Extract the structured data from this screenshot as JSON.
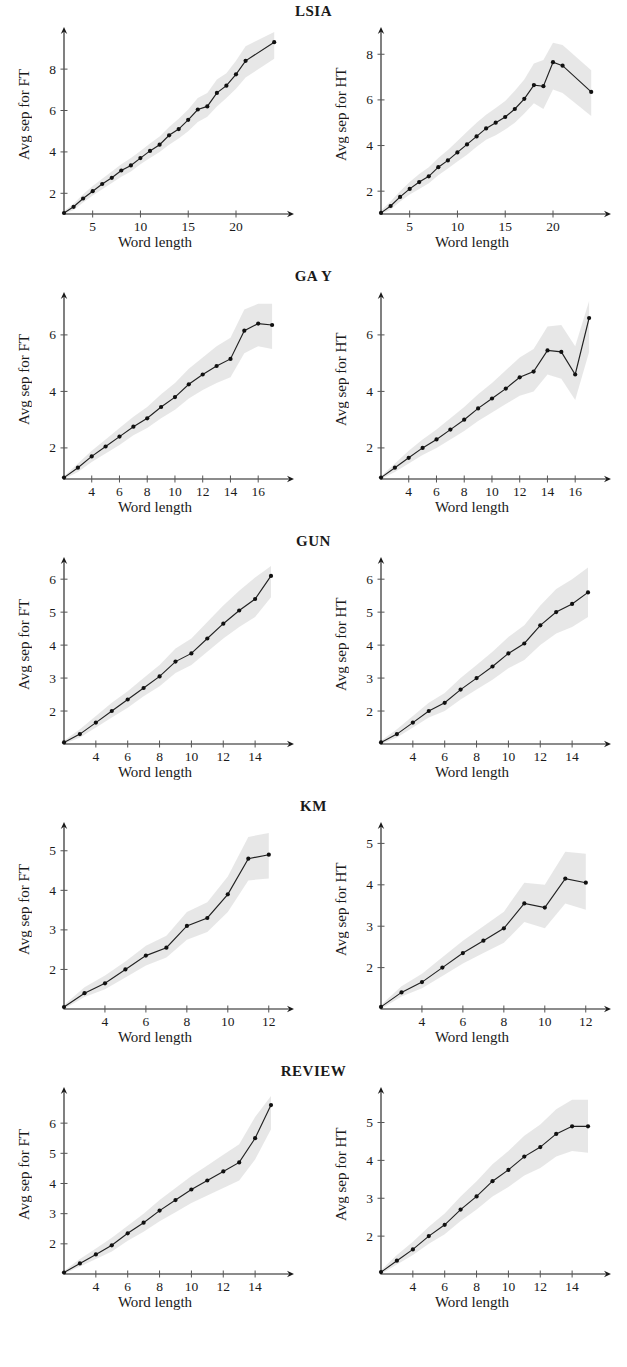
{
  "figure": {
    "xlabel": "Word length",
    "ylabel_ft": "Avg sep for FT",
    "ylabel_ht": "Avg sep for HT"
  },
  "rows": [
    {
      "title": "LSIA"
    },
    {
      "title": "GA Y"
    },
    {
      "title": "GUN"
    },
    {
      "title": "KM"
    },
    {
      "title": "REVIEW"
    }
  ],
  "chart_data": [
    {
      "type": "line",
      "title": "LSIA",
      "panel": "FT",
      "xlabel": "Word length",
      "ylabel": "Avg sep for FT",
      "xlim": [
        2,
        24.5
      ],
      "ylim": [
        1.0,
        9.6
      ],
      "xticks": [
        5,
        10,
        15,
        20
      ],
      "yticks": [
        2,
        4,
        6,
        8
      ],
      "grid": false,
      "legend": "none",
      "x": [
        2,
        3,
        4,
        5,
        6,
        7,
        8,
        9,
        10,
        11,
        12,
        13,
        14,
        15,
        16,
        17,
        18,
        19,
        20,
        21,
        24
      ],
      "values": [
        1.05,
        1.35,
        1.75,
        2.1,
        2.45,
        2.75,
        3.1,
        3.35,
        3.7,
        4.05,
        4.35,
        4.8,
        5.1,
        5.55,
        6.05,
        6.2,
        6.85,
        7.2,
        7.75,
        8.4,
        9.3
      ],
      "band_lower": [
        1.0,
        1.2,
        1.55,
        1.9,
        2.2,
        2.5,
        2.8,
        3.05,
        3.4,
        3.7,
        4.0,
        4.35,
        4.65,
        5.0,
        5.45,
        5.7,
        6.2,
        6.6,
        7.05,
        7.6,
        8.5
      ],
      "band_upper": [
        1.15,
        1.5,
        1.95,
        2.35,
        2.7,
        3.05,
        3.4,
        3.7,
        4.05,
        4.4,
        4.75,
        5.2,
        5.6,
        6.05,
        6.6,
        6.85,
        7.5,
        7.8,
        8.4,
        9.1,
        9.8
      ]
    },
    {
      "type": "line",
      "title": "LSIA",
      "panel": "HT",
      "xlabel": "Word length",
      "ylabel": "Avg sep for HT",
      "xlim": [
        2,
        24.5
      ],
      "ylim": [
        1.0,
        8.8
      ],
      "xticks": [
        5,
        10,
        15,
        20
      ],
      "yticks": [
        2,
        4,
        6,
        8
      ],
      "grid": false,
      "legend": "none",
      "x": [
        2,
        3,
        4,
        5,
        6,
        7,
        8,
        9,
        10,
        11,
        12,
        13,
        14,
        15,
        16,
        17,
        18,
        19,
        20,
        21,
        24
      ],
      "values": [
        1.05,
        1.35,
        1.75,
        2.1,
        2.4,
        2.65,
        3.05,
        3.35,
        3.7,
        4.05,
        4.4,
        4.75,
        5.0,
        5.25,
        5.6,
        6.05,
        6.65,
        6.6,
        7.65,
        7.5,
        6.35
      ],
      "band_lower": [
        1.0,
        1.2,
        1.55,
        1.85,
        2.1,
        2.35,
        2.7,
        3.0,
        3.3,
        3.6,
        3.95,
        4.25,
        4.45,
        4.7,
        5.0,
        5.4,
        5.85,
        5.6,
        6.45,
        6.3,
        5.3
      ],
      "band_upper": [
        1.15,
        1.55,
        2.0,
        2.4,
        2.75,
        3.05,
        3.45,
        3.8,
        4.2,
        4.6,
        5.0,
        5.35,
        5.65,
        5.95,
        6.4,
        6.9,
        7.6,
        7.75,
        8.5,
        8.4,
        7.3
      ]
    },
    {
      "type": "line",
      "title": "GA Y",
      "panel": "FT",
      "xlabel": "Word length",
      "ylabel": "Avg sep for FT",
      "xlim": [
        2,
        17.5
      ],
      "ylim": [
        0.9,
        7.2
      ],
      "xticks": [
        4,
        6,
        8,
        10,
        12,
        14,
        16
      ],
      "yticks": [
        2,
        4,
        6
      ],
      "grid": false,
      "legend": "none",
      "x": [
        2,
        3,
        4,
        5,
        6,
        7,
        8,
        9,
        10,
        11,
        12,
        13,
        14,
        15,
        16,
        17
      ],
      "values": [
        0.95,
        1.3,
        1.7,
        2.05,
        2.4,
        2.75,
        3.05,
        3.45,
        3.8,
        4.25,
        4.6,
        4.9,
        5.15,
        6.15,
        6.4,
        6.35
      ],
      "band_lower": [
        0.9,
        1.15,
        1.5,
        1.8,
        2.1,
        2.45,
        2.7,
        3.05,
        3.35,
        3.75,
        4.05,
        4.3,
        4.5,
        5.35,
        5.6,
        5.5
      ],
      "band_upper": [
        1.0,
        1.45,
        1.9,
        2.3,
        2.7,
        3.1,
        3.45,
        3.9,
        4.3,
        4.8,
        5.2,
        5.6,
        5.9,
        6.9,
        7.1,
        7.1
      ]
    },
    {
      "type": "line",
      "title": "GA Y",
      "panel": "HT",
      "xlabel": "Word length",
      "ylabel": "Avg sep for HT",
      "xlim": [
        2,
        17.5
      ],
      "ylim": [
        0.9,
        7.2
      ],
      "xticks": [
        4,
        6,
        8,
        10,
        12,
        14,
        16
      ],
      "yticks": [
        2,
        4,
        6
      ],
      "grid": false,
      "legend": "none",
      "x": [
        2,
        3,
        4,
        5,
        6,
        7,
        8,
        9,
        10,
        11,
        12,
        13,
        14,
        15,
        16,
        17
      ],
      "values": [
        0.95,
        1.3,
        1.65,
        2.0,
        2.3,
        2.65,
        3.0,
        3.4,
        3.75,
        4.1,
        4.5,
        4.7,
        5.45,
        5.4,
        4.6,
        6.6
      ],
      "band_lower": [
        0.9,
        1.15,
        1.45,
        1.75,
        2.0,
        2.3,
        2.6,
        2.95,
        3.25,
        3.55,
        3.85,
        4.0,
        4.6,
        4.45,
        3.7,
        5.4
      ],
      "band_upper": [
        1.0,
        1.45,
        1.9,
        2.3,
        2.65,
        3.05,
        3.45,
        3.9,
        4.3,
        4.75,
        5.2,
        5.5,
        6.3,
        6.35,
        5.6,
        7.2
      ]
    },
    {
      "type": "line",
      "title": "GUN",
      "panel": "FT",
      "xlabel": "Word length",
      "ylabel": "Avg sep for FT",
      "xlim": [
        2,
        15.5
      ],
      "ylim": [
        1.0,
        6.4
      ],
      "xticks": [
        4,
        6,
        8,
        10,
        12,
        14
      ],
      "yticks": [
        2,
        3,
        4,
        5,
        6
      ],
      "grid": false,
      "legend": "none",
      "x": [
        2,
        3,
        4,
        5,
        6,
        7,
        8,
        9,
        10,
        11,
        12,
        13,
        14,
        15
      ],
      "values": [
        1.05,
        1.3,
        1.65,
        2.0,
        2.35,
        2.7,
        3.05,
        3.5,
        3.75,
        4.2,
        4.65,
        5.05,
        5.4,
        6.1
      ],
      "band_lower": [
        1.0,
        1.2,
        1.5,
        1.8,
        2.1,
        2.45,
        2.75,
        3.15,
        3.4,
        3.8,
        4.2,
        4.55,
        4.85,
        5.45
      ],
      "band_upper": [
        1.1,
        1.45,
        1.85,
        2.25,
        2.6,
        3.0,
        3.4,
        3.9,
        4.2,
        4.7,
        5.2,
        5.65,
        6.05,
        6.4
      ]
    },
    {
      "type": "line",
      "title": "GUN",
      "panel": "HT",
      "xlabel": "Word length",
      "ylabel": "Avg sep for HT",
      "xlim": [
        2,
        15.5
      ],
      "ylim": [
        1.0,
        6.4
      ],
      "xticks": [
        4,
        6,
        8,
        10,
        12,
        14
      ],
      "yticks": [
        2,
        3,
        4,
        5,
        6
      ],
      "grid": false,
      "legend": "none",
      "x": [
        2,
        3,
        4,
        5,
        6,
        7,
        8,
        9,
        10,
        11,
        12,
        13,
        14,
        15
      ],
      "values": [
        1.05,
        1.3,
        1.65,
        2.0,
        2.25,
        2.65,
        3.0,
        3.35,
        3.75,
        4.05,
        4.6,
        5.0,
        5.25,
        5.6
      ],
      "band_lower": [
        1.0,
        1.2,
        1.5,
        1.8,
        2.0,
        2.35,
        2.65,
        2.95,
        3.3,
        3.55,
        4.0,
        4.35,
        4.55,
        4.85
      ],
      "band_upper": [
        1.1,
        1.45,
        1.85,
        2.25,
        2.55,
        3.0,
        3.4,
        3.8,
        4.25,
        4.6,
        5.2,
        5.7,
        6.0,
        6.35
      ]
    },
    {
      "type": "line",
      "title": "KM",
      "panel": "FT",
      "xlabel": "Word length",
      "ylabel": "Avg sep for FT",
      "xlim": [
        2,
        12.5
      ],
      "ylim": [
        1.0,
        5.5
      ],
      "xticks": [
        4,
        6,
        8,
        10,
        12
      ],
      "yticks": [
        2,
        3,
        4,
        5
      ],
      "grid": false,
      "legend": "none",
      "x": [
        2,
        3,
        4,
        5,
        6,
        7,
        8,
        9,
        10,
        11,
        12
      ],
      "values": [
        1.05,
        1.4,
        1.65,
        2.0,
        2.35,
        2.55,
        3.1,
        3.3,
        3.9,
        4.8,
        4.9
      ],
      "band_lower": [
        1.0,
        1.3,
        1.5,
        1.8,
        2.1,
        2.3,
        2.75,
        2.95,
        3.45,
        4.25,
        4.3
      ],
      "band_upper": [
        1.1,
        1.55,
        1.85,
        2.2,
        2.6,
        2.85,
        3.45,
        3.7,
        4.35,
        5.35,
        5.45
      ]
    },
    {
      "type": "line",
      "title": "KM",
      "panel": "HT",
      "xlabel": "Word length",
      "ylabel": "Avg sep for HT",
      "xlim": [
        2,
        12.5
      ],
      "ylim": [
        1.0,
        5.3
      ],
      "xticks": [
        4,
        6,
        8,
        10,
        12
      ],
      "yticks": [
        2,
        3,
        4,
        5
      ],
      "grid": false,
      "legend": "none",
      "x": [
        2,
        3,
        4,
        5,
        6,
        7,
        8,
        9,
        10,
        11,
        12
      ],
      "values": [
        1.05,
        1.4,
        1.65,
        2.0,
        2.35,
        2.65,
        2.95,
        3.55,
        3.45,
        4.15,
        4.05
      ],
      "band_lower": [
        1.0,
        1.3,
        1.5,
        1.8,
        2.1,
        2.35,
        2.6,
        3.1,
        2.95,
        3.55,
        3.4
      ],
      "band_upper": [
        1.1,
        1.55,
        1.85,
        2.25,
        2.65,
        3.0,
        3.35,
        4.05,
        4.0,
        4.8,
        4.75
      ]
    },
    {
      "type": "line",
      "title": "REVIEW",
      "panel": "FT",
      "xlabel": "Word length",
      "ylabel": "Avg sep for FT",
      "xlim": [
        2,
        15.5
      ],
      "ylim": [
        1.0,
        6.9
      ],
      "xticks": [
        4,
        6,
        8,
        10,
        12,
        14
      ],
      "yticks": [
        2,
        3,
        4,
        5,
        6
      ],
      "grid": false,
      "legend": "none",
      "x": [
        2,
        3,
        4,
        5,
        6,
        7,
        8,
        9,
        10,
        11,
        12,
        13,
        14,
        15
      ],
      "values": [
        1.05,
        1.35,
        1.65,
        1.95,
        2.35,
        2.7,
        3.1,
        3.45,
        3.8,
        4.1,
        4.4,
        4.7,
        5.5,
        6.6
      ],
      "band_lower": [
        1.0,
        1.25,
        1.5,
        1.75,
        2.1,
        2.4,
        2.75,
        3.05,
        3.35,
        3.6,
        3.85,
        4.1,
        4.8,
        5.8
      ],
      "band_upper": [
        1.1,
        1.5,
        1.85,
        2.2,
        2.6,
        3.0,
        3.45,
        3.85,
        4.25,
        4.6,
        4.95,
        5.3,
        6.2,
        6.9
      ]
    },
    {
      "type": "line",
      "title": "REVIEW",
      "panel": "HT",
      "xlabel": "Word length",
      "ylabel": "Avg sep for HT",
      "xlim": [
        2,
        15.5
      ],
      "ylim": [
        1.0,
        5.7
      ],
      "xticks": [
        4,
        6,
        8,
        10,
        12,
        14
      ],
      "yticks": [
        2,
        3,
        4,
        5
      ],
      "grid": false,
      "legend": "none",
      "x": [
        2,
        3,
        4,
        5,
        6,
        7,
        8,
        9,
        10,
        11,
        12,
        13,
        14,
        15
      ],
      "values": [
        1.05,
        1.35,
        1.65,
        2.0,
        2.3,
        2.7,
        3.05,
        3.45,
        3.75,
        4.1,
        4.35,
        4.7,
        4.9,
        4.9
      ],
      "band_lower": [
        1.0,
        1.25,
        1.5,
        1.8,
        2.05,
        2.4,
        2.7,
        3.05,
        3.3,
        3.6,
        3.8,
        4.1,
        4.25,
        4.2
      ],
      "band_upper": [
        1.1,
        1.5,
        1.85,
        2.25,
        2.6,
        3.05,
        3.45,
        3.9,
        4.25,
        4.65,
        4.95,
        5.35,
        5.6,
        5.6
      ]
    }
  ],
  "colors": {
    "line": "#222222",
    "band": "#e6e6e6",
    "axis": "#1a1a1a"
  }
}
